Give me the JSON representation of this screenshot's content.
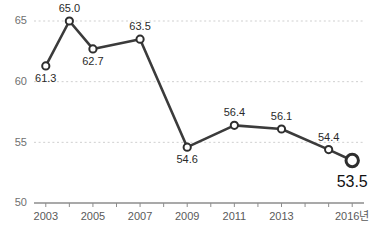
{
  "chart_data": {
    "type": "line",
    "title": "",
    "xlabel": "",
    "ylabel": "",
    "x": [
      2003,
      2004,
      2005,
      2007,
      2009,
      2011,
      2013,
      2015,
      2016
    ],
    "values": [
      61.3,
      65.0,
      62.7,
      63.5,
      54.6,
      56.4,
      56.1,
      54.4,
      53.5
    ],
    "point_labels": [
      "61.3",
      "65.0",
      "62.7",
      "63.5",
      "54.6",
      "56.4",
      "56.1",
      "54.4",
      "53.5"
    ],
    "label_positions": [
      "below",
      "above",
      "below",
      "above",
      "below",
      "above",
      "above",
      "above",
      "below"
    ],
    "ylim": [
      50,
      67
    ],
    "yticks": [
      50,
      55,
      60,
      65
    ],
    "ytick_labels": [
      "50",
      "55",
      "60",
      "65"
    ],
    "xlim": [
      2002.5,
      2016.5
    ],
    "xticks": [
      2003,
      2004,
      2005,
      2006,
      2007,
      2008,
      2009,
      2010,
      2011,
      2012,
      2013,
      2014,
      2015,
      2016
    ],
    "xtick_labels": [
      "2003",
      "2005",
      "2007",
      "2009",
      "2011",
      "2013",
      "2016년"
    ],
    "xtick_label_values": [
      2003,
      2005,
      2007,
      2009,
      2011,
      2013,
      2016
    ],
    "grid": true,
    "grid_style": "dotted-horizontal",
    "legend": null,
    "legend_position": "none",
    "series_color": "#3b3b3b",
    "marker_fill": "#ffffff",
    "marker_edge_color": "#2e2e2e",
    "grid_color": "#cfcfcf",
    "axis_color": "#8d8d8d",
    "highlight_last_point": true
  }
}
